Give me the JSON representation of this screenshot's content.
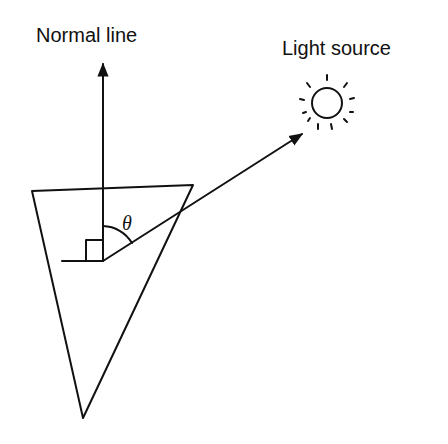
{
  "diagram": {
    "labels": {
      "normal_line": "Normal line",
      "light_source": "Light source",
      "angle": "θ"
    },
    "colors": {
      "line": "#111111",
      "background": "#ffffff"
    },
    "elements": {
      "prism": "inverted triangle (cone cross-section)",
      "normal_arrow": "vertical arrow pointing up",
      "light_ray": "arrow from surface vertex toward light source",
      "right_angle_marker": "square at vertex",
      "angle_arc": "arc between normal line and light ray",
      "sun_icon": "circle with radiating dashes"
    }
  }
}
